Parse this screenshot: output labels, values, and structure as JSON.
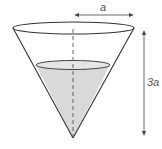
{
  "diagram": {
    "labels": {
      "radius": "a",
      "height": "3a"
    },
    "colors": {
      "outline": "#333333",
      "liquid_fill": "#d9d9d9",
      "arrow": "#444444"
    }
  }
}
